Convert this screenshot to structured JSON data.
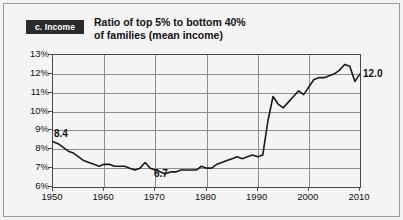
{
  "figure": {
    "section_badge": "c. Income",
    "title_line1": "Ratio of top 5% to bottom 40%",
    "title_line2": "of families (mean income)"
  },
  "chart_data": {
    "type": "line",
    "title": "Ratio of top 5% to bottom 40% of families (mean income)",
    "xlabel": "",
    "ylabel": "",
    "xlim": [
      1950,
      2010
    ],
    "ylim": [
      6,
      13
    ],
    "grid": true,
    "legend": "none",
    "y_tick_labels": [
      "13%",
      "12%",
      "11%",
      "10%",
      "9%",
      "8%",
      "7%",
      "6%"
    ],
    "y_tick_values": [
      13,
      12,
      11,
      10,
      9,
      8,
      7,
      6
    ],
    "x_tick_labels": [
      "1950",
      "1960",
      "1970",
      "1980",
      "1990",
      "2000",
      "2010"
    ],
    "x_tick_values": [
      1950,
      1960,
      1970,
      1980,
      1990,
      2000,
      2010
    ],
    "annotations": [
      {
        "name": "start-value",
        "text": "8.4",
        "x": 1950,
        "y": 8.4
      },
      {
        "name": "minimum-value",
        "text": "6.7",
        "x": 1970,
        "y": 6.7
      },
      {
        "name": "end-value",
        "text": "12.0",
        "x": 2010,
        "y": 12.0
      }
    ],
    "series": [
      {
        "name": "Ratio of top 5% to bottom 40%",
        "color": "#1a1a1a",
        "x": [
          1950,
          1951,
          1952,
          1953,
          1954,
          1955,
          1956,
          1957,
          1958,
          1959,
          1960,
          1961,
          1962,
          1963,
          1964,
          1965,
          1966,
          1967,
          1968,
          1969,
          1970,
          1971,
          1972,
          1973,
          1974,
          1975,
          1976,
          1977,
          1978,
          1979,
          1980,
          1981,
          1982,
          1983,
          1984,
          1985,
          1986,
          1987,
          1988,
          1989,
          1990,
          1991,
          1992,
          1993,
          1994,
          1995,
          1996,
          1997,
          1998,
          1999,
          2000,
          2001,
          2002,
          2003,
          2004,
          2005,
          2006,
          2007,
          2008,
          2009,
          2010
        ],
        "y": [
          8.4,
          8.3,
          8.1,
          7.9,
          7.8,
          7.6,
          7.4,
          7.3,
          7.2,
          7.1,
          7.2,
          7.2,
          7.1,
          7.1,
          7.1,
          7.0,
          6.9,
          7.0,
          7.3,
          7.0,
          6.9,
          6.8,
          6.7,
          6.8,
          6.8,
          6.9,
          6.9,
          6.9,
          6.9,
          7.1,
          7.0,
          7.0,
          7.2,
          7.3,
          7.4,
          7.5,
          7.6,
          7.5,
          7.6,
          7.7,
          7.6,
          7.7,
          9.5,
          10.8,
          10.4,
          10.2,
          10.5,
          10.8,
          11.1,
          10.9,
          11.3,
          11.7,
          11.8,
          11.8,
          11.9,
          12.0,
          12.2,
          12.5,
          12.4,
          11.6,
          12.0
        ]
      }
    ]
  }
}
